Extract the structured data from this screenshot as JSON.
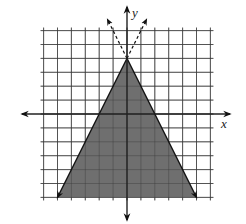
{
  "chart_data": {
    "type": "line",
    "title": "",
    "xlabel": "x",
    "ylabel": "y",
    "xlim": [
      -6,
      6
    ],
    "ylim": [
      -6,
      6
    ],
    "grid": true,
    "grid_step": 1,
    "tick_labels": false,
    "series": [
      {
        "name": "boundary-left",
        "equation": "y = 2x + 4",
        "style": "solid",
        "points": [
          [
            -5,
            -6
          ],
          [
            0,
            4
          ]
        ],
        "extension_style": "dashed"
      },
      {
        "name": "boundary-right",
        "equation": "y = -2x + 4",
        "style": "solid",
        "points": [
          [
            0,
            4
          ],
          [
            5,
            -6
          ]
        ],
        "extension_style": "dashed"
      }
    ],
    "shaded_region": {
      "description": "Region below both lines: y <= 2x + 4 and y <= -2x + 4",
      "vertices": [
        [
          0,
          4
        ],
        [
          -5,
          -6
        ],
        [
          5,
          -6
        ]
      ],
      "color": "#6f6f6f"
    },
    "apex": [
      0,
      4
    ],
    "x_intercepts": [
      -2,
      2
    ]
  },
  "labels": {
    "x_axis": "x",
    "y_axis": "y"
  },
  "colors": {
    "grid": "#3a3a3a",
    "axis": "#222222",
    "shade": "#6f6f6f",
    "background": "#ffffff"
  }
}
